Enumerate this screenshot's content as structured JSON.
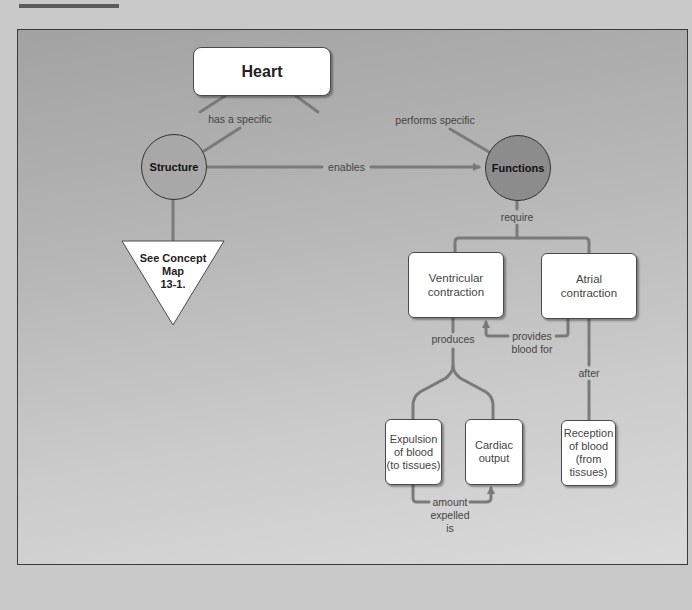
{
  "colors": {
    "page_bg": "#c9c9c9",
    "panel_top": "#a2a2a2",
    "panel_bottom": "#dadada",
    "connector": "#7a7a7a",
    "structure_fill": "#a8a8a8",
    "functions_fill": "#8c8c8c",
    "box_fill": "#ffffff"
  },
  "nodes": {
    "heart": "Heart",
    "structure": "Structure",
    "functions": "Functions",
    "see_concept_map": [
      "See Concept",
      "Map",
      "13-1."
    ],
    "ventricular": [
      "Ventricular",
      "contraction"
    ],
    "atrial": [
      "Atrial",
      "contraction"
    ],
    "expulsion": [
      "Expulsion",
      "of blood",
      "(to tissues)"
    ],
    "cardiac_output": [
      "Cardiac",
      "output"
    ],
    "reception": [
      "Reception",
      "of blood",
      "(from",
      "tissues)"
    ]
  },
  "links": {
    "has_a_specific": "has a specific",
    "performs_specific": "performs specific",
    "enables": "enables",
    "require": "require",
    "produces": "produces",
    "provides_blood_for": [
      "provides",
      "blood for"
    ],
    "after": "after",
    "amount_expelled_is": [
      "amount",
      "expelled",
      "is"
    ]
  }
}
